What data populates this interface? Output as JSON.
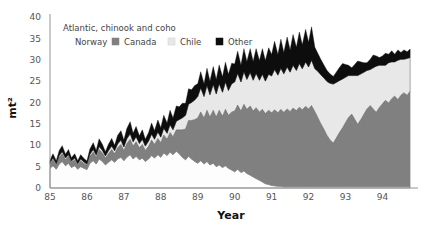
{
  "chart_data": {
    "type": "area",
    "stacked": true,
    "title": "",
    "xlabel": "Year",
    "ylabel": "mt²",
    "legend_title": "Atlantic, chinook and coho",
    "legend_position": "top-left-inside",
    "grid": false,
    "xlim": [
      85,
      94.8
    ],
    "ylim": [
      0,
      40
    ],
    "yticks": [
      0,
      5,
      10,
      15,
      20,
      25,
      30,
      35,
      40
    ],
    "xticks": [
      85,
      86,
      87,
      88,
      89,
      90,
      91,
      92,
      93,
      94
    ],
    "xtick_labels": [
      "85",
      "86",
      "87",
      "88",
      "89",
      "90",
      "91",
      "92",
      "93",
      "94"
    ],
    "ytick_labels": [
      "0",
      "5",
      "10",
      "15",
      "20",
      "25",
      "30",
      "35",
      "40"
    ],
    "colors": {
      "Norway": "#fdfdfd",
      "Canada": "#808080",
      "Chile": "#e8e8e8",
      "Other": "#0d0d0d"
    },
    "x": [
      85.0,
      85.08,
      85.17,
      85.25,
      85.33,
      85.42,
      85.5,
      85.58,
      85.67,
      85.75,
      85.83,
      85.92,
      86.0,
      86.08,
      86.17,
      86.25,
      86.33,
      86.42,
      86.5,
      86.58,
      86.67,
      86.75,
      86.83,
      86.92,
      87.0,
      87.08,
      87.17,
      87.25,
      87.33,
      87.42,
      87.5,
      87.58,
      87.67,
      87.75,
      87.83,
      87.92,
      88.0,
      88.08,
      88.17,
      88.25,
      88.33,
      88.42,
      88.5,
      88.58,
      88.67,
      88.75,
      88.83,
      88.92,
      89.0,
      89.08,
      89.17,
      89.25,
      89.33,
      89.42,
      89.5,
      89.58,
      89.67,
      89.75,
      89.83,
      89.92,
      90.0,
      90.08,
      90.17,
      90.25,
      90.33,
      90.42,
      90.5,
      90.58,
      90.67,
      90.75,
      90.83,
      90.92,
      91.0,
      91.08,
      91.17,
      91.25,
      91.33,
      91.42,
      91.5,
      91.58,
      91.67,
      91.75,
      91.83,
      91.92,
      92.0,
      92.08,
      92.17,
      92.25,
      92.33,
      92.42,
      92.5,
      92.58,
      92.67,
      92.75,
      92.83,
      92.92,
      93.0,
      93.08,
      93.17,
      93.25,
      93.33,
      93.42,
      93.5,
      93.58,
      93.67,
      93.75,
      93.83,
      93.92,
      94.0,
      94.08,
      94.17,
      94.25,
      94.33,
      94.42,
      94.5,
      94.58,
      94.67,
      94.75
    ],
    "series": [
      {
        "name": "Norway",
        "values": [
          4.6,
          5.2,
          4.4,
          5.6,
          6.2,
          5.2,
          5.8,
          4.8,
          5.2,
          4.4,
          5.0,
          4.6,
          4.3,
          5.8,
          6.4,
          5.6,
          6.8,
          6.2,
          5.4,
          6.0,
          6.6,
          6.0,
          6.8,
          7.2,
          6.4,
          7.2,
          7.8,
          6.8,
          7.4,
          6.6,
          7.0,
          6.2,
          6.8,
          7.6,
          7.0,
          7.8,
          7.2,
          8.2,
          7.6,
          8.4,
          7.8,
          8.6,
          8.0,
          7.2,
          6.6,
          7.4,
          6.8,
          6.2,
          5.8,
          6.4,
          5.6,
          6.2,
          5.4,
          5.8,
          5.0,
          5.4,
          4.8,
          5.2,
          4.6,
          4.2,
          3.8,
          4.4,
          3.6,
          4.0,
          3.4,
          3.0,
          2.6,
          2.2,
          1.8,
          1.4,
          1.0,
          0.8,
          0.6,
          0.5,
          0.4,
          0.4,
          0.3,
          0.3,
          0.3,
          0.3,
          0.3,
          0.3,
          0.3,
          0.3,
          0.3,
          0.3,
          0.3,
          0.3,
          0.3,
          0.3,
          0.3,
          0.3,
          0.3,
          0.3,
          0.3,
          0.3,
          0.3,
          0.3,
          0.3,
          0.3,
          0.3,
          0.3,
          0.3,
          0.3,
          0.3,
          0.3,
          0.3,
          0.3,
          0.3,
          0.3,
          0.3,
          0.3,
          0.3,
          0.3,
          0.3,
          0.3,
          0.3,
          0.3
        ]
      },
      {
        "name": "Canada",
        "values": [
          1.0,
          1.4,
          1.0,
          1.6,
          1.8,
          1.4,
          1.6,
          1.2,
          1.4,
          1.0,
          1.4,
          1.2,
          1.0,
          1.6,
          2.0,
          1.6,
          2.2,
          2.0,
          1.6,
          2.0,
          2.4,
          2.0,
          2.6,
          3.0,
          2.4,
          3.2,
          3.6,
          3.0,
          3.4,
          2.8,
          3.2,
          2.6,
          3.0,
          3.6,
          3.2,
          3.8,
          3.4,
          4.2,
          3.8,
          4.6,
          4.2,
          5.0,
          5.6,
          6.4,
          7.2,
          8.4,
          9.0,
          9.8,
          10.6,
          11.4,
          10.8,
          12.0,
          11.2,
          12.4,
          11.6,
          12.8,
          12.0,
          13.2,
          12.4,
          13.6,
          14.2,
          15.0,
          14.4,
          15.6,
          15.0,
          16.2,
          15.4,
          16.6,
          16.0,
          17.0,
          16.4,
          17.4,
          17.0,
          17.8,
          17.2,
          18.0,
          17.4,
          18.2,
          17.6,
          18.4,
          17.8,
          18.6,
          18.0,
          18.8,
          18.2,
          19.0,
          17.6,
          16.2,
          14.8,
          13.4,
          12.0,
          11.0,
          10.2,
          11.4,
          12.6,
          13.8,
          15.0,
          16.2,
          17.0,
          15.8,
          14.6,
          15.8,
          17.0,
          18.2,
          19.0,
          18.2,
          17.4,
          18.6,
          19.4,
          20.2,
          19.6,
          20.6,
          21.2,
          20.4,
          21.4,
          22.0,
          21.4,
          22.4
        ]
      },
      {
        "name": "Chile",
        "values": [
          0.3,
          0.4,
          0.3,
          0.4,
          0.5,
          0.4,
          0.4,
          0.3,
          0.4,
          0.3,
          0.4,
          0.3,
          0.3,
          0.5,
          0.6,
          0.5,
          0.7,
          0.6,
          0.5,
          0.7,
          0.8,
          0.7,
          0.9,
          1.0,
          0.8,
          1.1,
          1.3,
          1.0,
          1.2,
          1.0,
          1.2,
          1.0,
          1.2,
          1.4,
          1.2,
          1.5,
          1.3,
          1.6,
          1.4,
          1.8,
          1.6,
          2.0,
          2.4,
          2.8,
          3.2,
          3.8,
          4.2,
          4.6,
          5.0,
          5.6,
          5.0,
          5.8,
          5.2,
          6.0,
          5.4,
          6.2,
          5.6,
          6.4,
          5.8,
          6.6,
          6.8,
          7.4,
          6.8,
          7.6,
          7.0,
          7.8,
          7.2,
          8.0,
          7.4,
          8.2,
          7.6,
          8.4,
          8.6,
          9.4,
          8.8,
          9.6,
          9.0,
          9.8,
          9.2,
          10.0,
          9.4,
          10.2,
          9.6,
          10.4,
          9.8,
          10.6,
          10.0,
          10.8,
          11.4,
          12.0,
          12.6,
          13.2,
          13.8,
          13.0,
          12.2,
          11.4,
          10.6,
          9.8,
          9.0,
          10.2,
          11.4,
          10.6,
          9.8,
          9.0,
          8.4,
          9.6,
          10.8,
          9.8,
          9.0,
          8.2,
          9.4,
          8.6,
          8.0,
          9.2,
          8.4,
          7.8,
          8.6,
          7.8
        ]
      },
      {
        "name": "Other",
        "values": [
          0.6,
          1.0,
          0.7,
          1.2,
          1.4,
          0.9,
          1.2,
          0.8,
          1.0,
          0.7,
          1.0,
          0.8,
          0.7,
          1.2,
          1.6,
          1.1,
          1.8,
          1.4,
          1.0,
          1.5,
          1.8,
          1.3,
          2.0,
          2.2,
          1.6,
          2.4,
          2.8,
          2.0,
          2.4,
          1.8,
          2.2,
          1.6,
          2.0,
          2.6,
          2.0,
          2.8,
          2.2,
          3.0,
          2.4,
          3.4,
          2.8,
          3.6,
          3.0,
          3.4,
          2.8,
          3.6,
          3.0,
          3.4,
          3.0,
          3.8,
          3.0,
          4.0,
          3.2,
          4.2,
          3.4,
          4.4,
          3.6,
          4.6,
          3.8,
          4.8,
          4.2,
          5.2,
          4.0,
          5.4,
          4.2,
          5.6,
          4.4,
          5.8,
          4.6,
          6.0,
          4.8,
          6.2,
          5.0,
          6.6,
          4.8,
          6.8,
          5.0,
          7.0,
          5.2,
          7.2,
          5.4,
          7.4,
          5.6,
          7.6,
          5.8,
          7.8,
          5.0,
          4.2,
          3.6,
          3.0,
          2.6,
          2.2,
          1.8,
          2.4,
          3.0,
          3.6,
          3.0,
          2.4,
          1.8,
          2.6,
          3.4,
          2.8,
          2.2,
          1.8,
          2.4,
          3.0,
          2.4,
          1.8,
          2.2,
          2.8,
          2.0,
          2.6,
          1.8,
          2.4,
          1.6,
          2.2,
          1.6,
          2.0
        ]
      }
    ]
  },
  "legend": {
    "title": "Atlantic, chinook and coho",
    "items": [
      {
        "label": "Norway",
        "color": "#fdfdfd"
      },
      {
        "label": "Canada",
        "color": "#808080"
      },
      {
        "label": "Chile",
        "color": "#e8e8e8"
      },
      {
        "label": "Other",
        "color": "#0d0d0d"
      }
    ]
  }
}
